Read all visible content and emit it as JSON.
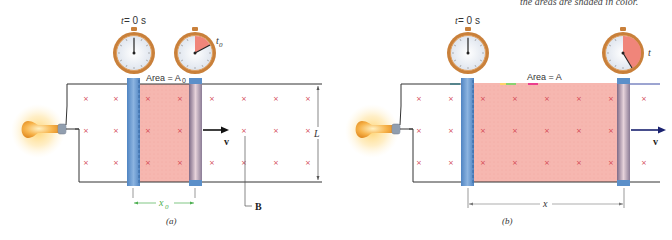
{
  "top_note": "the areas are shaded in color.",
  "colors": {
    "wire": "#333333",
    "rod_blue": "#5b8fc9",
    "rod_moving_dark": "#8a7b95",
    "flux_area": "#f6b7b0",
    "field_x": "#d2434f",
    "clock_rim": "#c9803a",
    "clock_face": "#eef1f5",
    "clock_sector": "#f0857a",
    "dimension_green": "#4caf50",
    "arrow": "#111111"
  },
  "panel_a": {
    "caption": "(a)",
    "clock_start_label_t": "t",
    "clock_start_label_rest": " = 0 s",
    "clock_end_label": "t",
    "clock_end_sub": "0",
    "area_label": "Area = A",
    "area_sub": "0",
    "velocity_label": "v",
    "length_label": "L",
    "field_label": "B",
    "dimension_label": "x",
    "dimension_sub": "0"
  },
  "panel_b": {
    "caption": "(b)",
    "clock_start_label_t": "t",
    "clock_start_label_rest": " = 0 s",
    "clock_end_label": "t",
    "area_label": "Area = A",
    "velocity_label": "v",
    "dimension_label": "x"
  },
  "field_marker": "×"
}
